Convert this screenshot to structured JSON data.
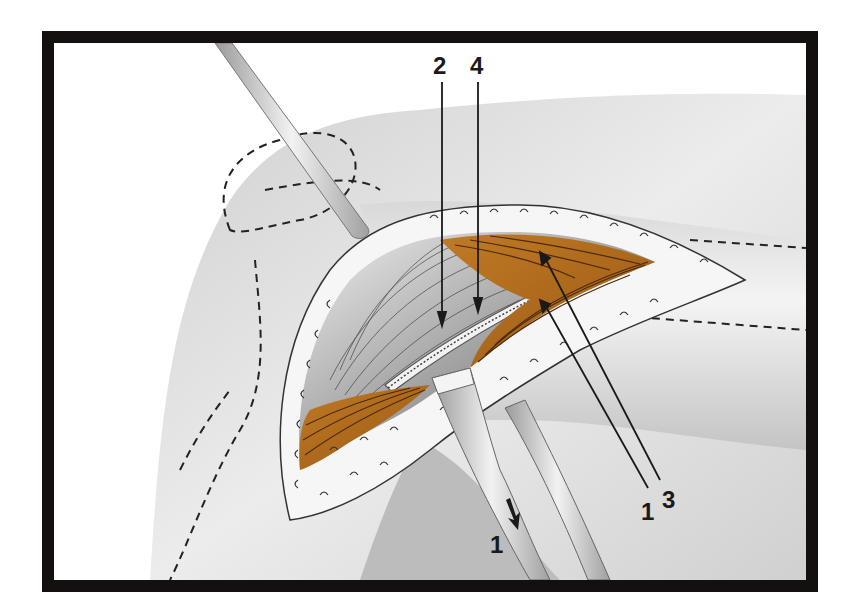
{
  "figure": {
    "colors": {
      "frame": "#141010",
      "muscle": "#b06a1c",
      "muscle_line": "#4a2a0a",
      "skin": "#e4e4e4",
      "skin_shadow": "#bdbdbd",
      "instrument": "#d6d6d6",
      "tendon": "#8a8a8a"
    },
    "labels": {
      "top_left": "2",
      "top_right": "4",
      "bottom_right_a": "1",
      "bottom_right_b": "3",
      "bottom_center": "1"
    }
  }
}
